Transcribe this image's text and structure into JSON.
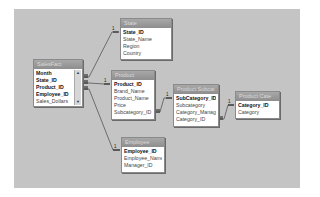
{
  "diagram": {
    "background": "#c4c4c4",
    "tables": [
      {
        "id": "salesfact",
        "title": "SalesFact",
        "fields": [
          {
            "name": "Month",
            "pk": true
          },
          {
            "name": "State_ID",
            "pk": true
          },
          {
            "name": "Product_ID",
            "pk": true
          },
          {
            "name": "Employee_ID",
            "pk": true
          },
          {
            "name": "Sales_Dollars",
            "pk": false
          }
        ]
      },
      {
        "id": "state",
        "title": "State",
        "fields": [
          {
            "name": "State_ID",
            "pk": true
          },
          {
            "name": "State_Name",
            "pk": false
          },
          {
            "name": "Region",
            "pk": false
          },
          {
            "name": "Country",
            "pk": false
          }
        ]
      },
      {
        "id": "product",
        "title": "Product",
        "fields": [
          {
            "name": "Product_ID",
            "pk": true
          },
          {
            "name": "Brand_Name",
            "pk": false
          },
          {
            "name": "Product_Name",
            "pk": false
          },
          {
            "name": "Price",
            "pk": false
          },
          {
            "name": "Subcategory_ID",
            "pk": false
          }
        ]
      },
      {
        "id": "productsubcat",
        "title": "Product Subcat",
        "fields": [
          {
            "name": "SubCategory_ID",
            "pk": true
          },
          {
            "name": "Subcategory",
            "pk": false
          },
          {
            "name": "Category_Manag",
            "pk": false
          },
          {
            "name": "Category_ID",
            "pk": false
          }
        ]
      },
      {
        "id": "productcat",
        "title": "Product Cate",
        "fields": [
          {
            "name": "Category_ID",
            "pk": true
          },
          {
            "name": "Category",
            "pk": false
          }
        ]
      },
      {
        "id": "employee",
        "title": "Employee",
        "fields": [
          {
            "name": "Employee_ID",
            "pk": true
          },
          {
            "name": "Employee_Name",
            "pk": false
          },
          {
            "name": "Manager_ID",
            "pk": false
          }
        ]
      }
    ],
    "relationships": [
      {
        "from": "SalesFact.State_ID",
        "to": "State.State_ID",
        "one": "1",
        "many": "∞"
      },
      {
        "from": "SalesFact.Product_ID",
        "to": "Product.Product_ID",
        "one": "1",
        "many": "∞"
      },
      {
        "from": "SalesFact.Employee_ID",
        "to": "Employee.Employee_ID",
        "one": "1",
        "many": "∞"
      },
      {
        "from": "Product.Subcategory_ID",
        "to": "Product Subcat.SubCategory_ID",
        "one": "1",
        "many": "∞"
      },
      {
        "from": "Product Subcat.Category_ID",
        "to": "Product Cate.Category_ID",
        "one": "1",
        "many": "∞"
      }
    ]
  }
}
